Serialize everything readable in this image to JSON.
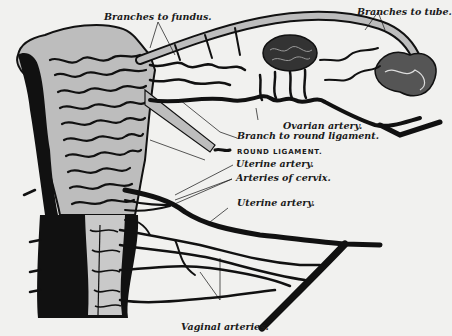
{
  "figure": {
    "background_color": "#f1f1ef",
    "ink_color": "#111111",
    "labels": {
      "branches_to_fundus": "Branches to fundus.",
      "branches_to_tube": "Branches to tube.",
      "ovarian_artery": "Ovarian artery.",
      "branch_to_round_ligament": "Branch to round ligament.",
      "round_ligament": "ROUND LIGAMENT.",
      "uterine_artery_upper": "Uterine artery.",
      "arteries_of_cervix": "Arteries of cervix.",
      "uterine_artery_lower": "Uterine artery.",
      "vaginal_arteries": "Vaginal arteries."
    }
  }
}
